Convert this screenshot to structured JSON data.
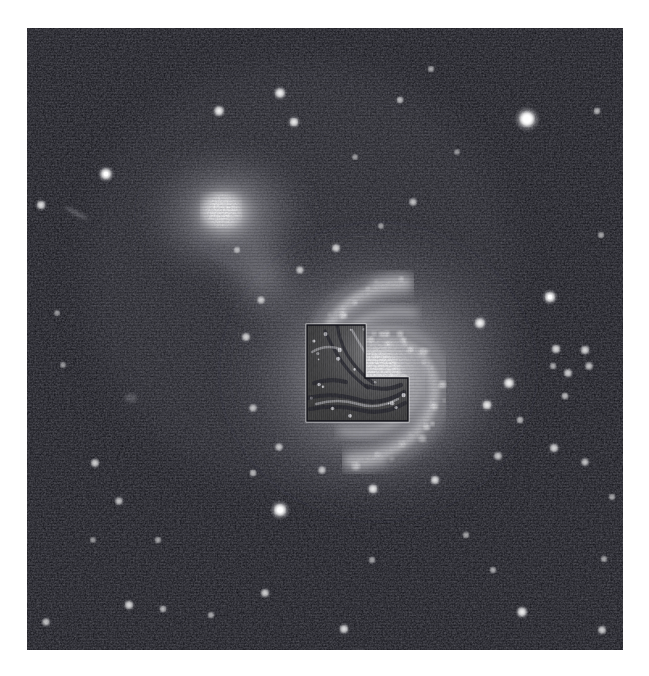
{
  "figure": {
    "kind": "astronomical-image",
    "colors": {
      "page_background": "#ffffff",
      "sky_background": "#0a0a10",
      "star_white": "#ffffff",
      "galaxy_glow": "#f2f2f2",
      "footprint_border": "#e8e8e8",
      "footprint_fill": "#3a3a3a"
    },
    "frame": {
      "x": 27,
      "y": 28,
      "width": 596,
      "height": 622
    }
  },
  "sky": {
    "noise_seed": 20240517,
    "noise_density": 1.0,
    "objects": [
      {
        "name": "companion-galaxy-ngc5195",
        "type": "galaxy",
        "cx": 227,
        "cy": 214,
        "core_r": 26,
        "halo_r": 74,
        "brightness": 1.0
      },
      {
        "name": "main-galaxy-m51",
        "type": "spiral-galaxy",
        "cx": 378,
        "cy": 372,
        "core_r": 36,
        "disk_r": 168,
        "brightness": 1.0,
        "arm_count": 2,
        "arm_turns": 1.05,
        "arm_rotation_deg": -18
      },
      {
        "name": "tidal-bridge",
        "type": "diffuse-feature",
        "cx": 262,
        "cy": 276,
        "brightness": 0.55
      },
      {
        "name": "background-edge-on-galaxy",
        "type": "galaxy",
        "cx": 76,
        "cy": 213,
        "brightness": 0.33
      },
      {
        "name": "faint-elliptical-galaxy",
        "type": "galaxy",
        "cx": 131,
        "cy": 398,
        "brightness": 0.3
      }
    ],
    "stars": [
      {
        "x": 527,
        "y": 119,
        "r": 6.4,
        "b": 1.0
      },
      {
        "x": 106,
        "y": 174,
        "r": 4.2,
        "b": 0.92
      },
      {
        "x": 41,
        "y": 205,
        "r": 3.0,
        "b": 0.78
      },
      {
        "x": 280,
        "y": 93,
        "r": 3.6,
        "b": 0.86
      },
      {
        "x": 219,
        "y": 111,
        "r": 3.4,
        "b": 0.84
      },
      {
        "x": 294,
        "y": 122,
        "r": 3.3,
        "b": 0.82
      },
      {
        "x": 400,
        "y": 100,
        "r": 2.4,
        "b": 0.62
      },
      {
        "x": 431,
        "y": 69,
        "r": 2.2,
        "b": 0.55
      },
      {
        "x": 597,
        "y": 111,
        "r": 2.4,
        "b": 0.6
      },
      {
        "x": 413,
        "y": 202,
        "r": 2.6,
        "b": 0.62
      },
      {
        "x": 381,
        "y": 226,
        "r": 2.0,
        "b": 0.52
      },
      {
        "x": 550,
        "y": 297,
        "r": 4.0,
        "b": 0.9
      },
      {
        "x": 585,
        "y": 350,
        "r": 3.0,
        "b": 0.72
      },
      {
        "x": 556,
        "y": 349,
        "r": 3.0,
        "b": 0.74
      },
      {
        "x": 568,
        "y": 373,
        "r": 2.8,
        "b": 0.7
      },
      {
        "x": 589,
        "y": 366,
        "r": 2.6,
        "b": 0.66
      },
      {
        "x": 553,
        "y": 366,
        "r": 2.2,
        "b": 0.58
      },
      {
        "x": 565,
        "y": 396,
        "r": 2.4,
        "b": 0.62
      },
      {
        "x": 554,
        "y": 448,
        "r": 3.0,
        "b": 0.7
      },
      {
        "x": 585,
        "y": 462,
        "r": 2.6,
        "b": 0.64
      },
      {
        "x": 480,
        "y": 323,
        "r": 3.6,
        "b": 0.86
      },
      {
        "x": 509,
        "y": 383,
        "r": 3.6,
        "b": 0.86
      },
      {
        "x": 487,
        "y": 405,
        "r": 3.3,
        "b": 0.8
      },
      {
        "x": 520,
        "y": 420,
        "r": 2.4,
        "b": 0.6
      },
      {
        "x": 498,
        "y": 456,
        "r": 2.8,
        "b": 0.66
      },
      {
        "x": 435,
        "y": 480,
        "r": 3.0,
        "b": 0.74
      },
      {
        "x": 373,
        "y": 489,
        "r": 3.3,
        "b": 0.8
      },
      {
        "x": 322,
        "y": 470,
        "r": 2.6,
        "b": 0.66
      },
      {
        "x": 279,
        "y": 447,
        "r": 2.6,
        "b": 0.66
      },
      {
        "x": 253,
        "y": 408,
        "r": 2.6,
        "b": 0.64
      },
      {
        "x": 246,
        "y": 337,
        "r": 2.8,
        "b": 0.7
      },
      {
        "x": 261,
        "y": 300,
        "r": 2.6,
        "b": 0.66
      },
      {
        "x": 300,
        "y": 270,
        "r": 2.6,
        "b": 0.66
      },
      {
        "x": 336,
        "y": 248,
        "r": 2.8,
        "b": 0.7
      },
      {
        "x": 280,
        "y": 510,
        "r": 5.0,
        "b": 0.96
      },
      {
        "x": 253,
        "y": 473,
        "r": 2.4,
        "b": 0.6
      },
      {
        "x": 95,
        "y": 463,
        "r": 2.8,
        "b": 0.7
      },
      {
        "x": 119,
        "y": 501,
        "r": 2.6,
        "b": 0.66
      },
      {
        "x": 158,
        "y": 540,
        "r": 2.2,
        "b": 0.55
      },
      {
        "x": 129,
        "y": 605,
        "r": 3.0,
        "b": 0.74
      },
      {
        "x": 46,
        "y": 622,
        "r": 2.6,
        "b": 0.66
      },
      {
        "x": 163,
        "y": 609,
        "r": 2.4,
        "b": 0.6
      },
      {
        "x": 211,
        "y": 615,
        "r": 2.2,
        "b": 0.56
      },
      {
        "x": 265,
        "y": 593,
        "r": 2.8,
        "b": 0.7
      },
      {
        "x": 344,
        "y": 629,
        "r": 3.0,
        "b": 0.76
      },
      {
        "x": 372,
        "y": 560,
        "r": 2.2,
        "b": 0.55
      },
      {
        "x": 466,
        "y": 535,
        "r": 2.2,
        "b": 0.55
      },
      {
        "x": 493,
        "y": 570,
        "r": 2.2,
        "b": 0.56
      },
      {
        "x": 522,
        "y": 612,
        "r": 3.4,
        "b": 0.84
      },
      {
        "x": 602,
        "y": 630,
        "r": 2.8,
        "b": 0.7
      },
      {
        "x": 604,
        "y": 559,
        "r": 2.2,
        "b": 0.55
      },
      {
        "x": 612,
        "y": 497,
        "r": 2.2,
        "b": 0.55
      },
      {
        "x": 57,
        "y": 313,
        "r": 2.0,
        "b": 0.5
      },
      {
        "x": 63,
        "y": 365,
        "r": 2.0,
        "b": 0.5
      },
      {
        "x": 93,
        "y": 540,
        "r": 2.0,
        "b": 0.5
      },
      {
        "x": 355,
        "y": 157,
        "r": 2.0,
        "b": 0.5
      },
      {
        "x": 457,
        "y": 152,
        "r": 2.0,
        "b": 0.48
      },
      {
        "x": 601,
        "y": 235,
        "r": 2.2,
        "b": 0.55
      },
      {
        "x": 237,
        "y": 250,
        "r": 2.2,
        "b": 0.56
      }
    ]
  },
  "wfpc2_footprint": {
    "label": "wfpc2-chevron-footprint",
    "shape": "L-shaped / chevron (3 WF chips + PC notch)",
    "notch_corner": "upper-right",
    "outline_color": "#e6e6e6",
    "bounds": {
      "left": 307,
      "top": 325,
      "right": 408,
      "bottom": 421,
      "step_x": 365,
      "step_y": 378
    },
    "inset_features": [
      "inner dust lanes",
      "nuclear spiral arms",
      "bright HII knots"
    ]
  }
}
